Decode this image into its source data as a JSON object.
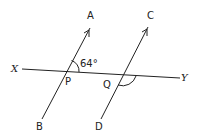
{
  "diagram": {
    "type": "parallel-lines-transversal",
    "labels": {
      "A": "A",
      "B": "B",
      "C": "C",
      "D": "D",
      "X": "X",
      "Y": "Y",
      "P": "P",
      "Q": "Q"
    },
    "angle_label": "64°",
    "lines": [
      {
        "name": "AB",
        "from": "B",
        "to": "A",
        "arrow": true
      },
      {
        "name": "CD",
        "from": "D",
        "to": "C",
        "arrow": true
      },
      {
        "name": "XY",
        "from": "X",
        "to": "Y",
        "arrow": false
      }
    ],
    "intersections": [
      {
        "point": "P",
        "lines": [
          "AB",
          "XY"
        ],
        "marked_angle": "APY",
        "value": "64°"
      },
      {
        "point": "Q",
        "lines": [
          "CD",
          "XY"
        ],
        "marked_angle": "DQY",
        "value": ""
      }
    ],
    "colors": {
      "stroke": "#222222",
      "background": "#ffffff"
    }
  }
}
